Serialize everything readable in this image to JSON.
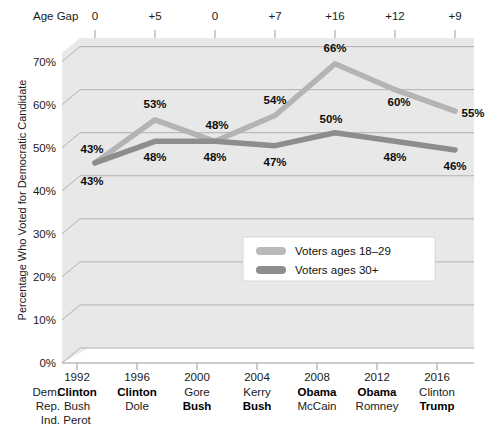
{
  "chart_data": {
    "type": "line",
    "title": "",
    "xlabel": "",
    "ylabel": "Percentage Who Voted for Democratic Candidate",
    "ylim": [
      0,
      72
    ],
    "grid": true,
    "legend_position": "inside-center-lower",
    "categories": [
      "1992",
      "1996",
      "2000",
      "2004",
      "2008",
      "2012",
      "2016"
    ],
    "series": [
      {
        "name": "Voters ages 18–29",
        "color": "#b4b4b4",
        "values": [
          43,
          53,
          48,
          54,
          66,
          60,
          55
        ]
      },
      {
        "name": "Voters ages 30+",
        "color": "#8d8d8d",
        "values": [
          43,
          48,
          48,
          47,
          50,
          48,
          46
        ]
      }
    ],
    "annotations": {
      "age_gap_header": "Age Gap",
      "age_gap_values": [
        "0",
        "+5",
        "0",
        "+7",
        "+16",
        "+12",
        "+9"
      ]
    },
    "yticks": [
      "0%",
      "10%",
      "20%",
      "30%",
      "40%",
      "50%",
      "60%",
      "70%"
    ],
    "ytick_values": [
      0,
      10,
      20,
      30,
      40,
      50,
      60,
      70
    ],
    "data_labels": {
      "youth": [
        "43%",
        "53%",
        "48%",
        "54%",
        "66%",
        "60%",
        "55%"
      ],
      "older": [
        "43%",
        "48%",
        "48%",
        "47%",
        "50%",
        "48%",
        "46%"
      ]
    }
  },
  "axis_table": {
    "row_labels": [
      "Dem.",
      "Rep.",
      "Ind."
    ],
    "columns": [
      {
        "year": "1992",
        "dem": "Clinton",
        "rep": "Bush",
        "ind": "Perot",
        "winner": "dem"
      },
      {
        "year": "1996",
        "dem": "Clinton",
        "rep": "Dole",
        "ind": "",
        "winner": "dem"
      },
      {
        "year": "2000",
        "dem": "Gore",
        "rep": "Bush",
        "ind": "",
        "winner": "rep"
      },
      {
        "year": "2004",
        "dem": "Kerry",
        "rep": "Bush",
        "ind": "",
        "winner": "rep"
      },
      {
        "year": "2008",
        "dem": "Obama",
        "rep": "McCain",
        "ind": "",
        "winner": "dem"
      },
      {
        "year": "2012",
        "dem": "Obama",
        "rep": "Romney",
        "ind": "",
        "winner": "dem"
      },
      {
        "year": "2016",
        "dem": "Clinton",
        "rep": "Trump",
        "ind": "",
        "winner": "rep"
      }
    ]
  },
  "legend": {
    "items": [
      {
        "label": "Voters ages 18–29",
        "color": "#b9b9b9"
      },
      {
        "label": "Voters ages 30+",
        "color": "#8d8d8d"
      }
    ]
  },
  "colors": {
    "plot_background": "#e8e8e8",
    "grid_line": "#b0b0b0",
    "youth_line": "#b6b6b6",
    "older_line": "#8d8d8d",
    "text": "#1a1a1a"
  }
}
